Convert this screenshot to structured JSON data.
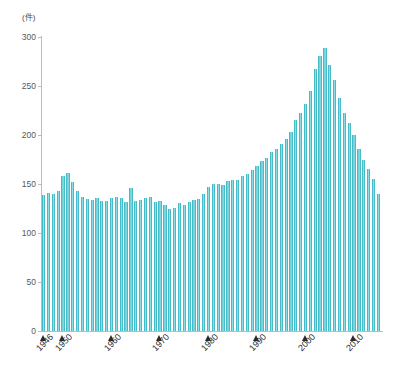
{
  "chart_data": {
    "type": "bar",
    "title": "",
    "subtitle": "",
    "xlabel": "",
    "ylabel": "",
    "unit_label": "(件)",
    "ylim": [
      0,
      300
    ],
    "yticks": [
      0,
      50,
      100,
      150,
      200,
      250,
      300
    ],
    "ytick_labels": [
      "0",
      "50",
      "100",
      "150",
      "200",
      "250",
      "300"
    ],
    "grid": false,
    "legend": null,
    "bar_color": "#46bcc8",
    "bar_highlight_color": "#8fdde4",
    "axis_color": "#b9bdc0",
    "marker_color": "#2b2b2b",
    "xtick_labels": [
      "1946",
      "1950",
      "1960",
      "1970",
      "1980",
      "1990",
      "2000",
      "2010"
    ],
    "xtick_years": [
      1946,
      1950,
      1960,
      1970,
      1980,
      1990,
      2000,
      2010
    ],
    "x": [
      1946,
      1947,
      1948,
      1949,
      1950,
      1951,
      1952,
      1953,
      1954,
      1955,
      1956,
      1957,
      1958,
      1959,
      1960,
      1961,
      1962,
      1963,
      1964,
      1965,
      1966,
      1967,
      1968,
      1969,
      1970,
      1971,
      1972,
      1973,
      1974,
      1975,
      1976,
      1977,
      1978,
      1979,
      1980,
      1981,
      1982,
      1983,
      1984,
      1985,
      1986,
      1987,
      1988,
      1989,
      1990,
      1991,
      1992,
      1993,
      1994,
      1995,
      1996,
      1997,
      1998,
      1999,
      2000,
      2001,
      2002,
      2003,
      2004,
      2005,
      2006,
      2007,
      2008,
      2009,
      2010,
      2011,
      2012,
      2013,
      2014,
      2015
    ],
    "categories": [
      "1946",
      "1947",
      "1948",
      "1949",
      "1950",
      "1951",
      "1952",
      "1953",
      "1954",
      "1955",
      "1956",
      "1957",
      "1958",
      "1959",
      "1960",
      "1961",
      "1962",
      "1963",
      "1964",
      "1965",
      "1966",
      "1967",
      "1968",
      "1969",
      "1970",
      "1971",
      "1972",
      "1973",
      "1974",
      "1975",
      "1976",
      "1977",
      "1978",
      "1979",
      "1980",
      "1981",
      "1982",
      "1983",
      "1984",
      "1985",
      "1986",
      "1987",
      "1988",
      "1989",
      "1990",
      "1991",
      "1992",
      "1993",
      "1994",
      "1995",
      "1996",
      "1997",
      "1998",
      "1999",
      "2000",
      "2001",
      "2002",
      "2003",
      "2004",
      "2005",
      "2006",
      "2007",
      "2008",
      "2009",
      "2010",
      "2011",
      "2012",
      "2013",
      "2014",
      "2015"
    ],
    "values": [
      139,
      141,
      140,
      143,
      158,
      161,
      152,
      143,
      137,
      135,
      134,
      136,
      133,
      133,
      136,
      137,
      136,
      132,
      146,
      133,
      134,
      136,
      137,
      132,
      133,
      129,
      125,
      126,
      131,
      129,
      132,
      134,
      135,
      140,
      147,
      150,
      150,
      149,
      153,
      154,
      154,
      158,
      160,
      164,
      168,
      173,
      177,
      183,
      186,
      191,
      196,
      203,
      215,
      222,
      232,
      245,
      267,
      281,
      289,
      271,
      256,
      238,
      222,
      212,
      200,
      186,
      175,
      165,
      155,
      140
    ],
    "annotations": {
      "peak_year": 2004,
      "peak_value": 289,
      "start_value": 139,
      "end_value": 140
    }
  }
}
